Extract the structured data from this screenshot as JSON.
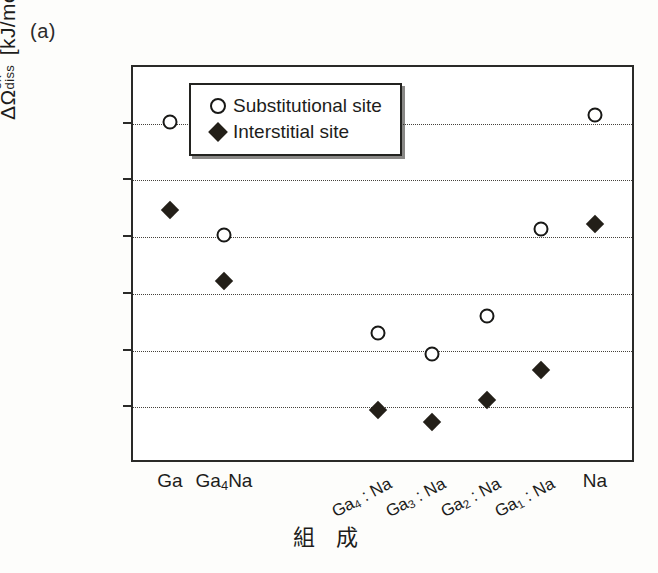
{
  "panel": {
    "label": "(a)"
  },
  "axes": {
    "y_title_symbol": "ΔΩ",
    "y_title_sup": "ex",
    "y_title_sub": "diss",
    "y_title_units": "[kJ/mol]",
    "x_title": "組 成"
  },
  "legend": {
    "items": [
      {
        "symbol": "open-circle",
        "label": "Substitutional site"
      },
      {
        "symbol": "filled-diamond",
        "label": "Interstitial site"
      }
    ]
  },
  "chart_data": {
    "type": "scatter",
    "title": "",
    "xlabel": "組 成",
    "ylabel": "ΔΩ_diss^ex [kJ/mol]",
    "ylim": [
      -50,
      300
    ],
    "yticks": [
      -50,
      0,
      50,
      100,
      150,
      200,
      250,
      300
    ],
    "ytick_labels": [
      "-50",
      "0",
      "50",
      "100",
      "150",
      "200",
      "250",
      "300"
    ],
    "grid": "horizontal-dotted",
    "legend_position": "top-center",
    "categories": [
      "Ga",
      "Ga4Na",
      "Ga4 : Na",
      "Ga3 : Na",
      "Ga2 : Na",
      "Ga1 : Na",
      "Na"
    ],
    "category_labels": [
      {
        "text": "Ga",
        "rotated": false
      },
      {
        "text": "Ga4Na",
        "rotated": false
      },
      {
        "text": "Ga4 : Na",
        "rotated": true
      },
      {
        "text": "Ga3 : Na",
        "rotated": true
      },
      {
        "text": "Ga2 : Na",
        "rotated": true
      },
      {
        "text": "Ga1 : Na",
        "rotated": true
      },
      {
        "text": "Na",
        "rotated": false
      }
    ],
    "series": [
      {
        "name": "Substitutional site",
        "marker": "open-circle",
        "color": "#181816",
        "values": [
          250,
          150,
          64,
          45,
          79,
          155,
          256
        ]
      },
      {
        "name": "Interstitial site",
        "marker": "filled-diamond",
        "color": "#231f18",
        "values": [
          172,
          110,
          -4,
          -15,
          5,
          31,
          160
        ]
      }
    ]
  }
}
